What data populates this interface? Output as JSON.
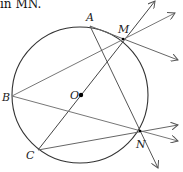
{
  "caption_fragment": "in MN.",
  "diagram": {
    "circle": {
      "center_label": "O",
      "cx": 80,
      "cy": 95,
      "r": 68,
      "color": "#333333"
    },
    "points": [
      {
        "label": "A",
        "x": 90,
        "y": 26
      },
      {
        "label": "M",
        "x": 123,
        "y": 39
      },
      {
        "label": "B",
        "x": 12,
        "y": 96
      },
      {
        "label": "O",
        "x": 81,
        "y": 95
      },
      {
        "label": "C",
        "x": 38,
        "y": 150
      },
      {
        "label": "N",
        "x": 140,
        "y": 131
      }
    ],
    "segments": [
      "AM",
      "BM",
      "BN",
      "CN",
      "CM",
      "AN"
    ],
    "rays": [
      "C→M",
      "A→M",
      "B→M",
      "A→N",
      "B→N",
      "C→N"
    ],
    "line_color": "#555555"
  }
}
